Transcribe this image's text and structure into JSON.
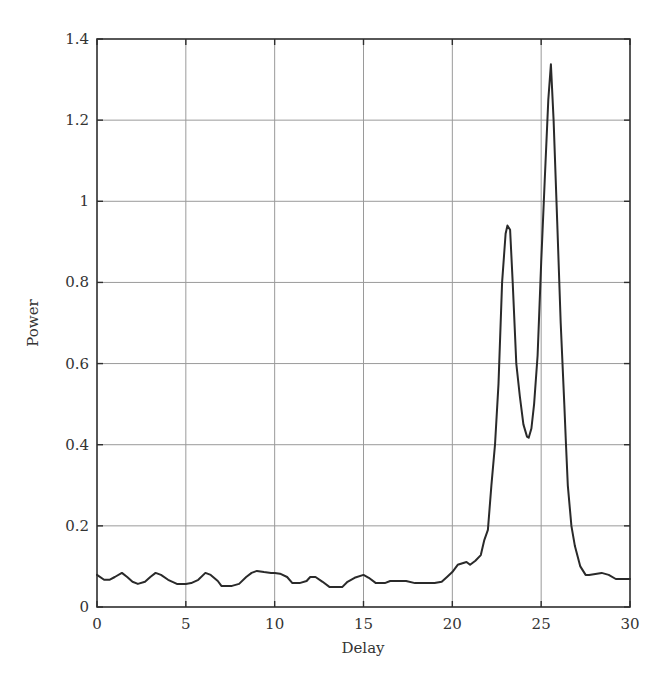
{
  "chart_data": {
    "type": "line",
    "title": "",
    "xlabel": "Delay",
    "ylabel": "Power",
    "xlim": [
      0,
      30
    ],
    "ylim": [
      0,
      1.4
    ],
    "grid": true,
    "legend": null,
    "xticks": [
      0,
      5,
      10,
      15,
      20,
      25,
      30
    ],
    "xtick_labels": [
      "0",
      "5",
      "10",
      "15",
      "20",
      "25",
      "30"
    ],
    "yticks": [
      0,
      0.2,
      0.4,
      0.6,
      0.8,
      1.0,
      1.2,
      1.4
    ],
    "ytick_labels": [
      "0",
      "0.2",
      "0.4",
      "0.6",
      "0.8",
      "1",
      "1.2",
      "1.4"
    ],
    "series": [
      {
        "name": "Power",
        "color": "#2a2a2a",
        "x": [
          0.0,
          0.4,
          0.7,
          1.0,
          1.4,
          1.7,
          2.0,
          2.3,
          2.7,
          3.0,
          3.3,
          3.6,
          4.0,
          4.5,
          5.0,
          5.3,
          5.7,
          6.1,
          6.4,
          6.8,
          7.0,
          7.6,
          8.0,
          8.4,
          8.7,
          9.0,
          9.4,
          9.8,
          10.0,
          10.3,
          10.7,
          11.0,
          11.4,
          11.8,
          12.0,
          12.3,
          12.7,
          13.1,
          13.4,
          13.8,
          14.1,
          14.5,
          15.0,
          15.3,
          15.7,
          16.2,
          16.5,
          17.1,
          17.4,
          17.9,
          18.2,
          18.6,
          19.0,
          19.4,
          19.7,
          20.0,
          20.3,
          20.8,
          21.0,
          21.3,
          21.6,
          21.8,
          22.0,
          22.2,
          22.4,
          22.6,
          22.8,
          23.0,
          23.1,
          23.25,
          23.4,
          23.6,
          23.8,
          24.0,
          24.2,
          24.3,
          24.45,
          24.6,
          24.8,
          25.0,
          25.2,
          25.4,
          25.55,
          25.7,
          25.9,
          26.1,
          26.3,
          26.4,
          26.5,
          26.7,
          26.9,
          27.2,
          27.5,
          27.7,
          28.4,
          28.8,
          29.2,
          30.0
        ],
        "y": [
          0.079,
          0.067,
          0.067,
          0.074,
          0.084,
          0.074,
          0.062,
          0.057,
          0.062,
          0.074,
          0.084,
          0.079,
          0.067,
          0.057,
          0.057,
          0.059,
          0.067,
          0.084,
          0.079,
          0.064,
          0.052,
          0.052,
          0.057,
          0.074,
          0.084,
          0.089,
          0.086,
          0.084,
          0.084,
          0.082,
          0.074,
          0.059,
          0.059,
          0.064,
          0.074,
          0.074,
          0.062,
          0.049,
          0.049,
          0.049,
          0.062,
          0.072,
          0.079,
          0.072,
          0.059,
          0.059,
          0.064,
          0.064,
          0.064,
          0.059,
          0.059,
          0.059,
          0.059,
          0.062,
          0.074,
          0.086,
          0.104,
          0.111,
          0.104,
          0.114,
          0.128,
          0.165,
          0.19,
          0.3,
          0.4,
          0.55,
          0.8,
          0.92,
          0.94,
          0.93,
          0.8,
          0.6,
          0.52,
          0.45,
          0.42,
          0.417,
          0.44,
          0.5,
          0.62,
          0.85,
          1.05,
          1.25,
          1.338,
          1.2,
          0.95,
          0.7,
          0.5,
          0.4,
          0.3,
          0.2,
          0.15,
          0.1,
          0.079,
          0.079,
          0.084,
          0.079,
          0.069,
          0.069
        ]
      }
    ]
  }
}
